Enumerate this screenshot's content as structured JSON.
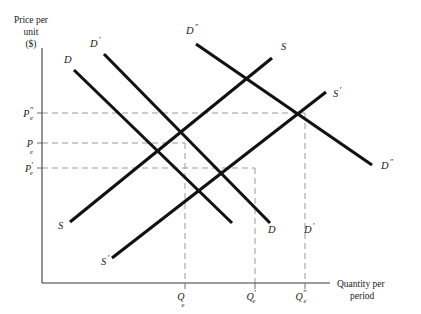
{
  "figure": {
    "background_color": "#ffffff",
    "curve_color": "#111111",
    "axis_color": "#3a3a3a",
    "guide_color": "#9a9a9a"
  },
  "axes": {
    "y_title_line1": "Price per",
    "y_title_line2": "unit",
    "y_title_line3": "($)",
    "x_title_line1": "Quantity per",
    "x_title_line2": "period"
  },
  "y_ticks": [
    {
      "name": "p-e-double-prime",
      "base": "P",
      "sub": "e",
      "prime": "″",
      "y": 113
    },
    {
      "name": "p-e",
      "base": "P",
      "sub": "e",
      "prime": "",
      "y": 143
    },
    {
      "name": "p-e-prime",
      "base": "P",
      "sub": "e",
      "prime": "′",
      "y": 168
    }
  ],
  "x_ticks": [
    {
      "name": "q-e",
      "base": "Q",
      "sub": "e",
      "prime": "",
      "x": 185
    },
    {
      "name": "q-e-prime",
      "base": "Q",
      "sub": "e",
      "prime": "′",
      "x": 255
    },
    {
      "name": "q-e-double-prime",
      "base": "Q",
      "sub": "e",
      "prime": "″",
      "x": 305
    }
  ],
  "curve_labels": [
    {
      "name": "demand-label-d",
      "base": "D",
      "prime": "",
      "x": 64,
      "y": 63
    },
    {
      "name": "demand-label-d-prime",
      "base": "D",
      "prime": "′",
      "x": 90,
      "y": 47
    },
    {
      "name": "demand-label-d-double-prime",
      "base": "D",
      "prime": "″",
      "x": 186,
      "y": 34
    },
    {
      "name": "supply-label-s-top",
      "base": "S",
      "prime": "",
      "x": 281,
      "y": 50
    },
    {
      "name": "supply-label-s-prime-right",
      "base": "S",
      "prime": "′",
      "x": 333,
      "y": 97
    },
    {
      "name": "demand-label-d-double-prime-right",
      "base": "D",
      "prime": "″",
      "x": 381,
      "y": 169
    },
    {
      "name": "supply-label-s-left",
      "base": "S",
      "prime": "",
      "x": 58,
      "y": 229
    },
    {
      "name": "supply-label-s-prime-left",
      "base": "S",
      "prime": "′",
      "x": 101,
      "y": 265
    },
    {
      "name": "demand-label-d-bottom",
      "base": "D",
      "prime": "",
      "x": 268,
      "y": 233
    },
    {
      "name": "demand-label-d-prime-bottom",
      "base": "D",
      "prime": "′",
      "x": 304,
      "y": 233
    }
  ],
  "chart_data": {
    "type": "line",
    "xlabel": "Quantity per period",
    "ylabel": "Price per unit ($)",
    "xlim": [
      42,
      400
    ],
    "ylim": [
      283,
      48
    ],
    "grid": false,
    "legend": "inline curve labels",
    "axis_origin": {
      "x": 42,
      "y": 283
    },
    "y_axis_top": 48,
    "x_axis_right": 330,
    "series": [
      {
        "name": "D",
        "label": "D",
        "type": "demand",
        "points": [
          {
            "x": 74,
            "y": 70
          },
          {
            "x": 232,
            "y": 223
          }
        ]
      },
      {
        "name": "D'",
        "label": "D′",
        "type": "demand",
        "points": [
          {
            "x": 104,
            "y": 54
          },
          {
            "x": 270,
            "y": 223
          }
        ]
      },
      {
        "name": "D''",
        "label": "D″",
        "type": "demand",
        "points": [
          {
            "x": 196,
            "y": 44
          },
          {
            "x": 372,
            "y": 165
          }
        ]
      },
      {
        "name": "S",
        "label": "S",
        "type": "supply",
        "points": [
          {
            "x": 70,
            "y": 222
          },
          {
            "x": 272,
            "y": 58
          }
        ]
      },
      {
        "name": "S'",
        "label": "S′",
        "type": "supply",
        "points": [
          {
            "x": 112,
            "y": 258
          },
          {
            "x": 326,
            "y": 92
          }
        ]
      }
    ],
    "equilibria": [
      {
        "name": "E",
        "price_label": "P_e",
        "quantity_label": "Q_e",
        "x": 185,
        "y": 143
      },
      {
        "name": "E'",
        "price_label": "P_e'",
        "quantity_label": "Q_e'",
        "x": 255,
        "y": 168
      },
      {
        "name": "E''",
        "price_label": "P_e''",
        "quantity_label": "Q_e''",
        "x": 305,
        "y": 113
      }
    ]
  }
}
